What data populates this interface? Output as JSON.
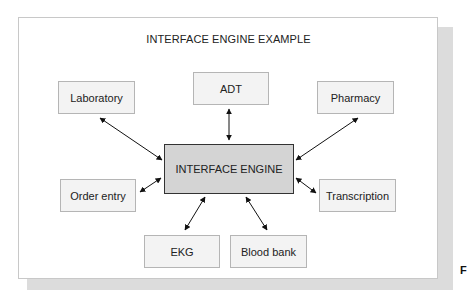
{
  "diagram": {
    "title": "INTERFACE ENGINE EXAMPLE",
    "center": {
      "label": "INTERFACE ENGINE"
    },
    "nodes": [
      {
        "id": "laboratory",
        "label": "Laboratory"
      },
      {
        "id": "adt",
        "label": "ADT"
      },
      {
        "id": "pharmacy",
        "label": "Pharmacy"
      },
      {
        "id": "order-entry",
        "label": "Order entry"
      },
      {
        "id": "transcription",
        "label": "Transcription"
      },
      {
        "id": "ekg",
        "label": "EKG"
      },
      {
        "id": "blood-bank",
        "label": "Blood bank"
      }
    ],
    "edges": [
      {
        "from": "interface-engine",
        "to": "laboratory",
        "type": "bidirectional"
      },
      {
        "from": "interface-engine",
        "to": "adt",
        "type": "bidirectional"
      },
      {
        "from": "interface-engine",
        "to": "pharmacy",
        "type": "bidirectional"
      },
      {
        "from": "interface-engine",
        "to": "order-entry",
        "type": "bidirectional"
      },
      {
        "from": "interface-engine",
        "to": "transcription",
        "type": "bidirectional"
      },
      {
        "from": "interface-engine",
        "to": "ekg",
        "type": "bidirectional"
      },
      {
        "from": "interface-engine",
        "to": "blood-bank",
        "type": "bidirectional"
      }
    ],
    "colors": {
      "node_fill": "#f3f3f3",
      "center_fill": "#d4d4d4",
      "arrow": "#111111"
    }
  },
  "edge_label": "F"
}
